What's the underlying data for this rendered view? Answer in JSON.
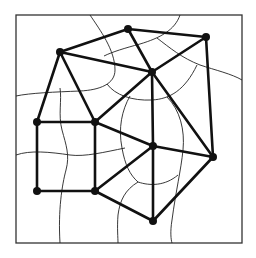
{
  "diagram": {
    "type": "graph-with-dual-curves",
    "frame": {
      "x": 16,
      "y": 15,
      "width": 226,
      "height": 228
    },
    "colors": {
      "edge": "#111111",
      "vertex": "#111111",
      "curve": "#222222",
      "frame": "#333333",
      "background": "#ffffff"
    },
    "vertices": [
      {
        "id": "A",
        "x": 60,
        "y": 52
      },
      {
        "id": "B",
        "x": 128,
        "y": 29
      },
      {
        "id": "C",
        "x": 206,
        "y": 37
      },
      {
        "id": "D",
        "x": 152,
        "y": 72
      },
      {
        "id": "E",
        "x": 37,
        "y": 122
      },
      {
        "id": "F",
        "x": 95,
        "y": 122
      },
      {
        "id": "G",
        "x": 153,
        "y": 146
      },
      {
        "id": "H",
        "x": 213,
        "y": 157
      },
      {
        "id": "I",
        "x": 37,
        "y": 191
      },
      {
        "id": "J",
        "x": 95,
        "y": 191
      },
      {
        "id": "K",
        "x": 153,
        "y": 221
      }
    ],
    "edges": [
      [
        "A",
        "B"
      ],
      [
        "B",
        "C"
      ],
      [
        "A",
        "D"
      ],
      [
        "B",
        "D"
      ],
      [
        "C",
        "D"
      ],
      [
        "C",
        "H"
      ],
      [
        "A",
        "E"
      ],
      [
        "A",
        "F"
      ],
      [
        "E",
        "F"
      ],
      [
        "E",
        "I"
      ],
      [
        "F",
        "J"
      ],
      [
        "I",
        "J"
      ],
      [
        "F",
        "D"
      ],
      [
        "F",
        "G"
      ],
      [
        "D",
        "G"
      ],
      [
        "D",
        "H"
      ],
      [
        "G",
        "H"
      ],
      [
        "G",
        "J"
      ],
      [
        "J",
        "K"
      ],
      [
        "G",
        "K"
      ],
      [
        "K",
        "H"
      ]
    ],
    "curves": [
      "M 90 15 C 100 30, 115 50, 115 70 C 115 84, 100 90, 80 91 C 55 92, 30 93, 16 96",
      "M 180 15 C 175 30, 160 38, 140 44 C 125 48, 112 52, 104 56",
      "M 157 38 C 170 48, 182 58, 200 65 C 215 70, 232 74, 242 80",
      "M 107 84 C 115 95, 132 101, 152 100 C 170 99, 185 90, 197 65",
      "M 60 88 C 62 100, 58 115, 62 130 C 66 145, 70 155, 66 170 C 62 185, 58 210, 60 243",
      "M 16 155 C 30 150, 50 152, 70 155 C 85 157, 105 152, 125 148",
      "M 130 96 C 122 110, 118 128, 122 148 C 125 165, 130 175, 138 182",
      "M 167 97 C 180 110, 185 130, 183 150 C 181 170, 176 190, 172 220 C 170 232, 171 240, 172 243",
      "M 138 182 C 125 190, 120 200, 118 215 C 117 228, 118 238, 118 243",
      "M 138 182 C 150 186, 165 186, 178 175"
    ]
  }
}
